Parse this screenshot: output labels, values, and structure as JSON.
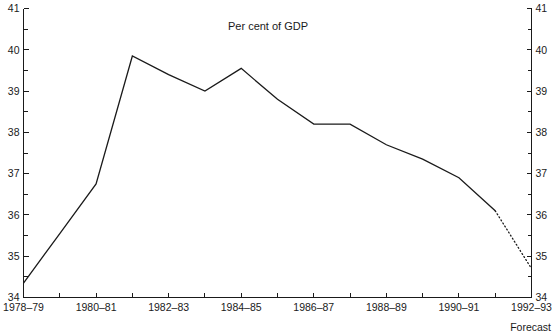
{
  "chart_data": {
    "type": "line",
    "title": "Per cent of GDP",
    "xlabel": "",
    "ylabel": "",
    "ylim": [
      34,
      41
    ],
    "xlim": [
      "1978-79",
      "1992-93"
    ],
    "grid": false,
    "legend": null,
    "y_ticks_major": [
      34,
      35,
      36,
      37,
      38,
      39,
      40,
      41
    ],
    "y_ticks_minor": [
      34.5,
      35.5,
      36.5,
      37.5,
      38.5,
      39.5,
      40.5
    ],
    "y_tick_labels_left": [
      "34",
      "35",
      "36",
      "37",
      "38",
      "39",
      "40",
      "41"
    ],
    "y_tick_labels_right": [
      "34",
      "35",
      "36",
      "37",
      "38",
      "39",
      "40",
      "41"
    ],
    "x_categories": [
      "1978-79",
      "1979-80",
      "1980-81",
      "1981-82",
      "1982-83",
      "1983-84",
      "1984-85",
      "1985-86",
      "1986-87",
      "1987-88",
      "1988-89",
      "1989-90",
      "1990-91",
      "1991-92",
      "1992-93"
    ],
    "x_tick_labels": [
      "1978–79",
      "1980–81",
      "1982–83",
      "1984–85",
      "1986–87",
      "1988–89",
      "1990–91",
      "1992–93"
    ],
    "x_tick_label_indices": [
      0,
      2,
      4,
      6,
      8,
      10,
      12,
      14
    ],
    "values": [
      34.35,
      35.55,
      36.75,
      39.85,
      39.4,
      39.0,
      39.55,
      38.8,
      38.2,
      38.2,
      37.7,
      37.35,
      36.9,
      36.75,
      36.1
    ],
    "series": [
      {
        "name": "Actual",
        "style": "solid",
        "x": [
          "1978-79",
          "1979-80",
          "1980-81",
          "1981-82",
          "1982-83",
          "1983-84",
          "1984-85",
          "1985-86",
          "1986-87",
          "1987-88",
          "1988-89",
          "1989-90",
          "1990-91",
          "1991-92"
        ],
        "values": [
          34.35,
          35.55,
          36.75,
          39.85,
          39.4,
          39.0,
          39.55,
          38.8,
          38.2,
          38.2,
          37.7,
          37.35,
          36.9,
          36.1
        ]
      },
      {
        "name": "Forecast",
        "style": "dotted",
        "x": [
          "1991-92",
          "1992-93"
        ],
        "values": [
          36.1,
          34.7
        ]
      }
    ],
    "annotations": [
      {
        "text": "Forecast",
        "position": "bottom-right"
      }
    ]
  },
  "footer": {
    "forecast_note": "Forecast"
  }
}
